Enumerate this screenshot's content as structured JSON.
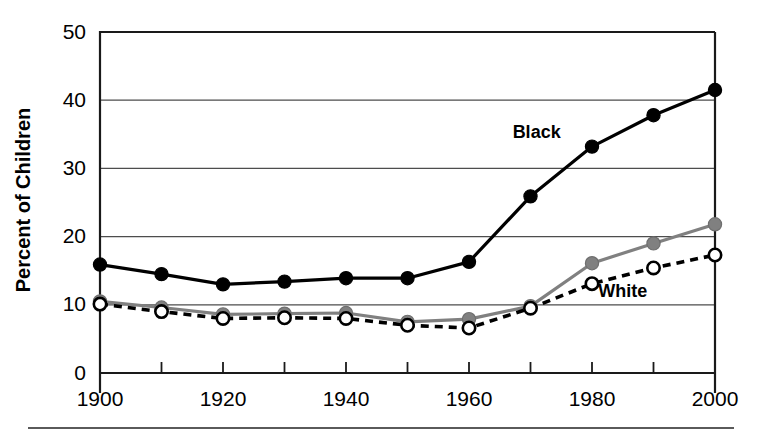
{
  "chart_data": {
    "type": "line",
    "title": "",
    "xlabel": "",
    "ylabel": "Percent of Children",
    "x": [
      1900,
      1910,
      1920,
      1930,
      1940,
      1950,
      1960,
      1970,
      1980,
      1990,
      2000
    ],
    "xlim": [
      1900,
      2000
    ],
    "ylim": [
      0,
      50
    ],
    "xticks": [
      1900,
      1910,
      1920,
      1930,
      1940,
      1950,
      1960,
      1970,
      1980,
      1990,
      2000
    ],
    "xtick_labels": [
      "1900",
      "",
      "1920",
      "",
      "1940",
      "",
      "1960",
      "",
      "1980",
      "",
      "2000"
    ],
    "yticks": [
      0,
      10,
      20,
      30,
      40,
      50
    ],
    "ytick_labels": [
      "0",
      "10",
      "20",
      "30",
      "40",
      "50"
    ],
    "grid": "horizontal",
    "legend_position": "inline-annotation",
    "series": [
      {
        "name": "Black",
        "marker": "filled-circle",
        "line_style": "solid",
        "color": "#000000",
        "marker_fill": "#000000",
        "annotation": "Black",
        "annotation_x": 1971,
        "annotation_y": 34.5,
        "values": [
          15.9,
          14.5,
          13.0,
          13.4,
          13.9,
          13.9,
          16.3,
          25.9,
          33.2,
          37.8,
          41.5
        ]
      },
      {
        "name": "Gray series",
        "marker": "filled-circle",
        "line_style": "solid",
        "color": "#808080",
        "marker_fill": "#808080",
        "annotation": "",
        "values": [
          10.5,
          9.6,
          8.6,
          8.7,
          8.8,
          7.5,
          7.9,
          9.8,
          16.1,
          19.0,
          21.8
        ]
      },
      {
        "name": "White",
        "marker": "open-circle",
        "line_style": "dashed",
        "color": "#000000",
        "marker_fill": "#ffffff",
        "annotation": "White",
        "annotation_x": 1985,
        "annotation_y": 11.2,
        "values": [
          10.1,
          9.0,
          8.0,
          8.1,
          8.0,
          7.0,
          6.6,
          9.5,
          13.1,
          15.4,
          17.3
        ]
      }
    ]
  },
  "axis": {
    "y_title": "Percent of Children"
  }
}
